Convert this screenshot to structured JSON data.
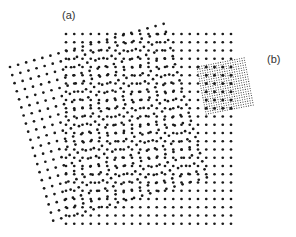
{
  "figure": {
    "labels": {
      "a": "(a)",
      "b": "(b)"
    },
    "colors": {
      "dot": "#1a1a1a",
      "mesh": "#333333",
      "background": "#ffffff"
    },
    "lattice_a": {
      "origin": [
        66,
        34
      ],
      "spacing": 8.25,
      "cols": 21,
      "rows": 24,
      "angle_deg": 0,
      "dot_radius": 1.35
    },
    "lattice_b": {
      "origin": [
        10,
        67
      ],
      "spacing": 8.4,
      "cols": 20,
      "rows": 20,
      "angle_deg": -15.7,
      "dot_radius": 1.35
    },
    "inset_b": {
      "origin": [
        197,
        67
      ],
      "spacing": 2.4,
      "cols": 20,
      "rows": 20,
      "angle_deg": -11,
      "dot_radius": 0.55,
      "coarse_spacing": 8.25
    }
  }
}
